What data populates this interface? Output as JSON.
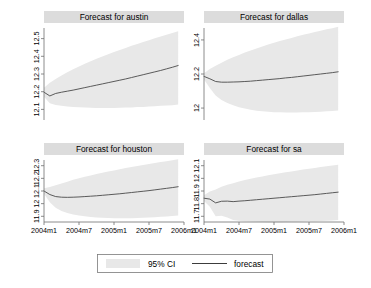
{
  "figure": {
    "background_color": "#ffffff",
    "panel_title_bar_color": "#dcdcdc",
    "ci_band_color": "#e8e8e8",
    "forecast_line_color": "#4a4a4a",
    "axis_color": "#6e6e6e"
  },
  "legend": {
    "ci_label": "95% CI",
    "forecast_label": "forecast"
  },
  "chart_data": [
    {
      "type": "area",
      "title": "Forecast for austin",
      "xlabel": "",
      "ylabel": "",
      "grid": false,
      "legend_position": "bottom",
      "x": [
        "2004m1",
        "2004m2",
        "2004m3",
        "2004m4",
        "2004m5",
        "2004m6",
        "2004m7",
        "2004m8",
        "2004m9",
        "2004m10",
        "2004m11",
        "2004m12",
        "2005m1",
        "2005m2",
        "2005m3",
        "2005m4",
        "2005m5",
        "2005m6",
        "2005m7",
        "2005m8",
        "2005m9",
        "2005m10",
        "2005m11",
        "2005m12"
      ],
      "xticks": [
        "2004m1",
        "2004m7",
        "2005m1",
        "2005m7",
        "2006m1"
      ],
      "xtick_values": [
        0,
        6,
        12,
        18,
        24
      ],
      "xlim": [
        0,
        24
      ],
      "yticks": [
        12.1,
        12.2,
        12.3,
        12.4,
        12.5
      ],
      "ytick_labels": [
        "12.1",
        "12.2",
        "12.3",
        "12.4",
        "12.5"
      ],
      "ylim": [
        12.04,
        12.56
      ],
      "series": [
        {
          "name": "forecast",
          "values": [
            12.197,
            12.176,
            12.19,
            12.197,
            12.203,
            12.209,
            12.216,
            12.223,
            12.23,
            12.237,
            12.244,
            12.251,
            12.258,
            12.265,
            12.272,
            12.28,
            12.288,
            12.296,
            12.304,
            12.312,
            12.32,
            12.329,
            12.338,
            12.348
          ]
        },
        {
          "name": "ci_upper",
          "values": [
            12.222,
            12.25,
            12.272,
            12.292,
            12.31,
            12.327,
            12.343,
            12.358,
            12.372,
            12.386,
            12.399,
            12.412,
            12.424,
            12.436,
            12.447,
            12.459,
            12.47,
            12.481,
            12.491,
            12.502,
            12.512,
            12.522,
            12.532,
            12.542
          ]
        },
        {
          "name": "ci_lower",
          "values": [
            12.172,
            12.134,
            12.125,
            12.12,
            12.117,
            12.114,
            12.112,
            12.11,
            12.109,
            12.108,
            12.108,
            12.108,
            12.108,
            12.109,
            12.11,
            12.111,
            12.113,
            12.114,
            12.116,
            12.118,
            12.12,
            12.122,
            12.124,
            12.127
          ]
        }
      ]
    },
    {
      "type": "area",
      "title": "Forecast for dallas",
      "xlabel": "",
      "ylabel": "",
      "grid": false,
      "legend_position": "bottom",
      "x": [
        "2004m1",
        "2004m2",
        "2004m3",
        "2004m4",
        "2004m5",
        "2004m6",
        "2004m7",
        "2004m8",
        "2004m9",
        "2004m10",
        "2004m11",
        "2004m12",
        "2005m1",
        "2005m2",
        "2005m3",
        "2005m4",
        "2005m5",
        "2005m6",
        "2005m7",
        "2005m8",
        "2005m9",
        "2005m10",
        "2005m11",
        "2005m12"
      ],
      "xticks": [
        "2004m1",
        "2004m7",
        "2005m1",
        "2005m7",
        "2006m1"
      ],
      "xtick_values": [
        0,
        6,
        12,
        18,
        24
      ],
      "xlim": [
        0,
        24
      ],
      "yticks": [
        12.0,
        12.2,
        12.4
      ],
      "ytick_labels": [
        "12",
        "12.2",
        "12.4"
      ],
      "ylim": [
        11.93,
        12.47
      ],
      "series": [
        {
          "name": "forecast",
          "values": [
            12.186,
            12.172,
            12.156,
            12.152,
            12.152,
            12.153,
            12.154,
            12.156,
            12.158,
            12.161,
            12.164,
            12.167,
            12.17,
            12.173,
            12.177,
            12.18,
            12.184,
            12.188,
            12.192,
            12.196,
            12.2,
            12.204,
            12.208,
            12.213
          ]
        },
        {
          "name": "ci_upper",
          "values": [
            12.205,
            12.23,
            12.248,
            12.266,
            12.283,
            12.298,
            12.312,
            12.326,
            12.338,
            12.35,
            12.362,
            12.373,
            12.383,
            12.393,
            12.403,
            12.412,
            12.421,
            12.43,
            12.438,
            12.446,
            12.454,
            12.462,
            12.469,
            12.477
          ]
        },
        {
          "name": "ci_lower",
          "values": [
            12.168,
            12.118,
            12.074,
            12.048,
            12.03,
            12.016,
            12.005,
            11.997,
            11.99,
            11.985,
            11.981,
            11.978,
            11.976,
            11.975,
            11.974,
            11.974,
            11.974,
            11.975,
            11.976,
            11.977,
            11.979,
            11.981,
            11.983,
            11.986
          ]
        }
      ]
    },
    {
      "type": "area",
      "title": "Forecast for houston",
      "xlabel": "",
      "ylabel": "",
      "grid": false,
      "legend_position": "bottom",
      "x": [
        "2004m1",
        "2004m2",
        "2004m3",
        "2004m4",
        "2004m5",
        "2004m6",
        "2004m7",
        "2004m8",
        "2004m9",
        "2004m10",
        "2004m11",
        "2004m12",
        "2005m1",
        "2005m2",
        "2005m3",
        "2005m4",
        "2005m5",
        "2005m6",
        "2005m7",
        "2005m8",
        "2005m9",
        "2005m10",
        "2005m11",
        "2005m12"
      ],
      "xticks": [
        "2004m1",
        "2004m7",
        "2005m1",
        "2005m7",
        "2006m1"
      ],
      "xtick_values": [
        0,
        6,
        12,
        18,
        24
      ],
      "xlim": [
        0,
        24
      ],
      "yticks": [
        11.9,
        12.0,
        12.1,
        12.2,
        12.3
      ],
      "ytick_labels": [
        "11.9",
        "12",
        "12.1",
        "12.2",
        "12.3"
      ],
      "ylim": [
        11.855,
        12.345
      ],
      "series": [
        {
          "name": "forecast",
          "values": [
            12.1,
            12.072,
            12.056,
            12.051,
            12.05,
            12.051,
            12.053,
            12.056,
            12.059,
            12.062,
            12.066,
            12.07,
            12.074,
            12.078,
            12.083,
            12.088,
            12.093,
            12.098,
            12.103,
            12.109,
            12.115,
            12.121,
            12.127,
            12.134
          ]
        },
        {
          "name": "ci_upper",
          "values": [
            12.122,
            12.132,
            12.145,
            12.16,
            12.174,
            12.188,
            12.2,
            12.212,
            12.223,
            12.234,
            12.244,
            12.254,
            12.263,
            12.272,
            12.281,
            12.289,
            12.298,
            12.306,
            12.313,
            12.321,
            12.329,
            12.336,
            12.343,
            12.351
          ]
        },
        {
          "name": "ci_lower",
          "values": [
            12.078,
            12.012,
            11.967,
            11.942,
            11.926,
            11.914,
            11.906,
            11.9,
            11.895,
            11.891,
            11.888,
            11.886,
            11.885,
            11.884,
            11.884,
            11.885,
            11.886,
            11.888,
            11.89,
            11.893,
            11.896,
            11.899,
            11.903,
            11.907
          ]
        }
      ]
    },
    {
      "type": "area",
      "title": "Forecast for sa",
      "xlabel": "",
      "ylabel": "",
      "grid": false,
      "legend_position": "bottom",
      "x": [
        "2004m1",
        "2004m2",
        "2004m3",
        "2004m4",
        "2004m5",
        "2004m6",
        "2004m7",
        "2004m8",
        "2004m9",
        "2004m10",
        "2004m11",
        "2004m12",
        "2005m1",
        "2005m2",
        "2005m3",
        "2005m4",
        "2005m5",
        "2005m6",
        "2005m7",
        "2005m8",
        "2005m9",
        "2005m10",
        "2005m11",
        "2005m12"
      ],
      "xticks": [
        "2004m1",
        "2004m7",
        "2005m1",
        "2005m7",
        "2006m1"
      ],
      "xtick_values": [
        0,
        6,
        12,
        18,
        24
      ],
      "xlim": [
        0,
        24
      ],
      "yticks": [
        11.7,
        11.8,
        11.9,
        12.0,
        12.1
      ],
      "ytick_labels": [
        "11.7",
        "11.8",
        "11.9",
        "12",
        "12.1"
      ],
      "ylim": [
        11.655,
        12.145
      ],
      "series": [
        {
          "name": "forecast",
          "values": [
            11.843,
            11.836,
            11.806,
            11.819,
            11.82,
            11.816,
            11.82,
            11.823,
            11.827,
            11.831,
            11.835,
            11.839,
            11.843,
            11.847,
            11.851,
            11.855,
            11.859,
            11.863,
            11.867,
            11.871,
            11.876,
            11.881,
            11.886,
            11.891
          ]
        },
        {
          "name": "ci_upper",
          "values": [
            11.866,
            11.897,
            11.912,
            11.934,
            11.95,
            11.962,
            11.975,
            11.986,
            11.996,
            12.006,
            12.015,
            12.024,
            12.032,
            12.04,
            12.048,
            12.055,
            12.062,
            12.069,
            12.076,
            12.082,
            12.089,
            12.095,
            12.101,
            12.108
          ]
        },
        {
          "name": "ci_lower",
          "values": [
            11.82,
            11.775,
            11.7,
            11.704,
            11.69,
            11.67,
            11.665,
            11.66,
            11.658,
            11.656,
            11.655,
            11.654,
            11.654,
            11.654,
            11.655,
            11.656,
            11.657,
            11.658,
            11.66,
            11.661,
            11.663,
            11.665,
            11.667,
            11.67
          ]
        }
      ]
    }
  ]
}
